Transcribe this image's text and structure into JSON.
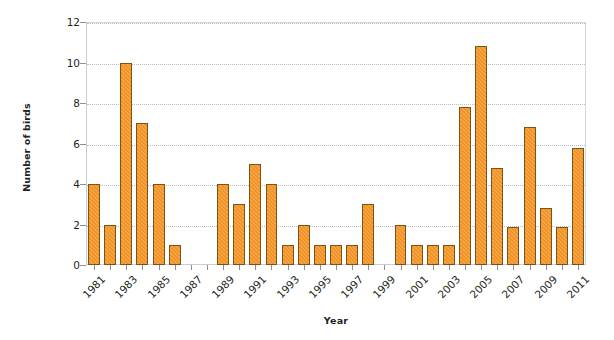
{
  "chart_data": {
    "type": "bar",
    "title": "",
    "xlabel": "Year",
    "ylabel": "Number of birds",
    "ylim": [
      0,
      12
    ],
    "yticks": [
      0,
      2,
      4,
      6,
      8,
      10,
      12
    ],
    "grid": true,
    "legend": false,
    "bar_color": "#f29222",
    "bar_edge_color": "#7b5414",
    "categories": [
      "1981",
      "1982",
      "1983",
      "1984",
      "1985",
      "1986",
      "1987",
      "1988",
      "1989",
      "1990",
      "1991",
      "1992",
      "1993",
      "1994",
      "1995",
      "1996",
      "1997",
      "1998",
      "1999",
      "2000",
      "2001",
      "2002",
      "2003",
      "2004",
      "2005",
      "2006",
      "2007",
      "2008",
      "2009",
      "2010",
      "2011"
    ],
    "values": [
      4,
      2,
      10,
      7,
      4,
      1,
      0,
      0,
      4,
      3,
      5,
      4,
      1,
      2,
      1,
      1,
      1,
      3,
      0,
      2,
      1,
      1,
      1,
      7.8,
      10.8,
      4.8,
      1.9,
      6.8,
      2.8,
      1.9,
      5.8
    ],
    "xtick_labels": [
      "1981",
      "1983",
      "1985",
      "1987",
      "1989",
      "1991",
      "1993",
      "1995",
      "1997",
      "1999",
      "2001",
      "2003",
      "2005",
      "2007",
      "2009",
      "2011"
    ],
    "note": "Bars omitted (zero) for 1987, 1988 and 1999; final bar 2011 = 7.8"
  },
  "axes": {
    "y_title": "Number of birds",
    "x_title": "Year"
  }
}
